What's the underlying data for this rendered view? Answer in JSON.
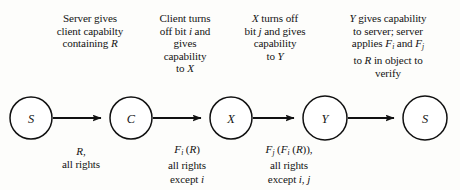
{
  "diagram": {
    "type": "sequence-flow",
    "nodes": [
      {
        "id": "node-s-1",
        "label": "S",
        "cx": 31,
        "cy": 118,
        "r": 21
      },
      {
        "id": "node-c",
        "label": "C",
        "cx": 131,
        "cy": 118,
        "r": 21
      },
      {
        "id": "node-x",
        "label": "X",
        "cx": 231,
        "cy": 118,
        "r": 21
      },
      {
        "id": "node-y",
        "label": "Y",
        "cx": 325,
        "cy": 118,
        "r": 22
      },
      {
        "id": "node-s-2",
        "label": "S",
        "cx": 425,
        "cy": 118,
        "r": 22
      }
    ],
    "captions": [
      {
        "id": "caption-server-gives",
        "lines": [
          [
            {
              "t": "Server gives"
            }
          ],
          [
            {
              "t": "client capabilty"
            }
          ],
          [
            {
              "t": "containing "
            },
            {
              "t": "R",
              "i": true
            }
          ]
        ]
      },
      {
        "id": "caption-client-turns-off",
        "lines": [
          [
            {
              "t": "Client turns"
            }
          ],
          [
            {
              "t": "off bit "
            },
            {
              "t": "i",
              "i": true
            },
            {
              "t": " and"
            }
          ],
          [
            {
              "t": "gives"
            }
          ],
          [
            {
              "t": "capability"
            }
          ],
          [
            {
              "t": "to "
            },
            {
              "t": "X",
              "i": true
            }
          ]
        ]
      },
      {
        "id": "caption-x-turns-off",
        "lines": [
          [
            {
              "t": "X",
              "i": true
            },
            {
              "t": " turns off"
            }
          ],
          [
            {
              "t": "bit "
            },
            {
              "t": "j",
              "i": true
            },
            {
              "t": " and gives"
            }
          ],
          [
            {
              "t": "capability"
            }
          ],
          [
            {
              "t": "to "
            },
            {
              "t": "Y",
              "i": true
            }
          ]
        ]
      },
      {
        "id": "caption-y-gives-server",
        "lines": [
          [
            {
              "t": "Y",
              "i": true
            },
            {
              "t": " gives capability"
            }
          ],
          [
            {
              "t": "to server; server"
            }
          ],
          [
            {
              "t": "applies "
            },
            {
              "t": "F",
              "i": true
            },
            {
              "t": "i",
              "sub": true
            },
            {
              "t": " and "
            },
            {
              "t": "F",
              "i": true
            },
            {
              "t": "j",
              "sub": true
            }
          ],
          [
            {
              "t": "to "
            },
            {
              "t": "R",
              "i": true
            },
            {
              "t": " in object to"
            }
          ],
          [
            {
              "t": "verify"
            }
          ]
        ]
      }
    ],
    "edge_labels": [
      {
        "id": "edge-label-r-all-rights",
        "lines": [
          [
            {
              "t": "R",
              "i": true
            },
            {
              "t": ","
            }
          ],
          [
            {
              "t": "all rights"
            }
          ]
        ]
      },
      {
        "id": "edge-label-fi-r",
        "lines": [
          [
            {
              "t": "F",
              "i": true
            },
            {
              "t": "i",
              "sub": true
            },
            {
              "t": " ("
            },
            {
              "t": "R",
              "i": true
            },
            {
              "t": ")"
            }
          ],
          [
            {
              "t": "all rights"
            }
          ],
          [
            {
              "t": "except "
            },
            {
              "t": "i",
              "i": true
            }
          ]
        ]
      },
      {
        "id": "edge-label-fj-fi-r",
        "lines": [
          [
            {
              "t": "F",
              "i": true
            },
            {
              "t": "j",
              "sub": true
            },
            {
              "t": " ("
            },
            {
              "t": "F",
              "i": true
            },
            {
              "t": "i",
              "sub": true
            },
            {
              "t": " ("
            },
            {
              "t": "R",
              "i": true
            },
            {
              "t": ")),"
            }
          ],
          [
            {
              "t": "all rights"
            }
          ],
          [
            {
              "t": "except "
            },
            {
              "t": "i",
              "i": true
            },
            {
              "t": ", "
            },
            {
              "t": "j",
              "i": true
            }
          ]
        ]
      }
    ],
    "colors": {
      "background": "#fdfdfb",
      "ink": "#141414",
      "stroke": "#111111",
      "node_fill": "#ffffff"
    }
  }
}
